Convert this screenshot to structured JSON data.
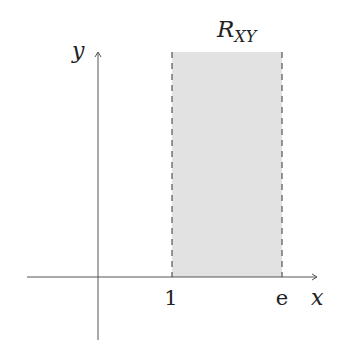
{
  "diagram": {
    "type": "region-plot",
    "axes": {
      "x_label": "x",
      "y_label": "y"
    },
    "region": {
      "label_main": "R",
      "label_sub": "XY",
      "x_start_label": "1",
      "x_end_label": "e",
      "fill_color": "#e2e2e2",
      "border_style": "dashed",
      "border_color": "#555555"
    },
    "colors": {
      "axis": "#555555",
      "text": "#222222"
    }
  }
}
